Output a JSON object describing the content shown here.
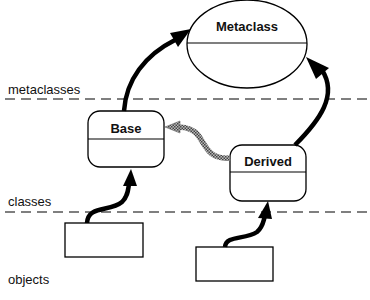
{
  "diagram": {
    "layers": [
      {
        "id": "metaclasses",
        "label": "metaclasses"
      },
      {
        "id": "classes",
        "label": "classes"
      },
      {
        "id": "objects",
        "label": "objects"
      }
    ],
    "nodes": {
      "metaclass": {
        "label": "Metaclass",
        "shape": "ellipse"
      },
      "base": {
        "label": "Base",
        "shape": "rounded-rect"
      },
      "derived": {
        "label": "Derived",
        "shape": "rounded-rect"
      },
      "object1": {
        "label": "",
        "shape": "rect"
      },
      "object2": {
        "label": "",
        "shape": "rect"
      }
    },
    "edges": [
      {
        "from": "base",
        "to": "metaclass",
        "type": "instance-of",
        "style": "solid-bold"
      },
      {
        "from": "derived",
        "to": "metaclass",
        "type": "instance-of",
        "style": "solid-bold"
      },
      {
        "from": "derived",
        "to": "base",
        "type": "inherits",
        "style": "hatched-gray"
      },
      {
        "from": "object1",
        "to": "base",
        "type": "instance-of",
        "style": "solid-bold"
      },
      {
        "from": "object2",
        "to": "derived",
        "type": "instance-of",
        "style": "solid-bold"
      }
    ],
    "colors": {
      "stroke": "#000000",
      "inherit": "#888888",
      "background": "#ffffff"
    }
  }
}
